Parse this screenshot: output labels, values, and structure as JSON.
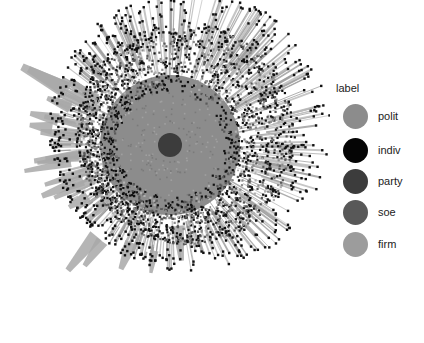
{
  "figure": {
    "type": "network-graph",
    "layout": "radial",
    "center": [
      170,
      145
    ],
    "core_radius": 12,
    "inner_disc_radius": 52,
    "dense_ring_radius": 110,
    "outer_radius": 165
  },
  "legend": {
    "title": "label",
    "items": [
      {
        "label": "polit",
        "color": "#8c8c8c"
      },
      {
        "label": "indiv",
        "color": "#050505"
      },
      {
        "label": "party",
        "color": "#3c3c3c"
      },
      {
        "label": "soe",
        "color": "#585858"
      },
      {
        "label": "firm",
        "color": "#9c9c9c"
      }
    ]
  }
}
